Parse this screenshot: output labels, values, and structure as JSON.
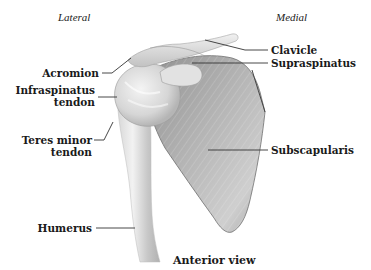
{
  "figure": {
    "orientation": {
      "left": "Lateral",
      "right": "Medial"
    },
    "caption": "Anterior view",
    "labels": {
      "acromion": "Acromion",
      "infraspinatus_line1": "Infraspinatus",
      "infraspinatus_line2": "tendon",
      "teres_minor_line1": "Teres minor",
      "teres_minor_line2": "tendon",
      "humerus": "Humerus",
      "clavicle": "Clavicle",
      "supraspinatus": "Supraspinatus",
      "subscapularis": "Subscapularis"
    },
    "colors": {
      "bone_light": "#e8e8e8",
      "bone_mid": "#c4c4c4",
      "bone_dark": "#8e8e8e",
      "leader_line": "#333333",
      "text": "#1a1a1a"
    }
  }
}
